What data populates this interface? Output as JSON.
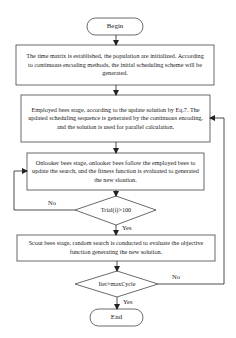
{
  "flowchart": {
    "begin": "Begin",
    "init_step": "The time matrix is established, the population are initialized. According to continuous encoding methods, the initial scheduling scheme will be generated.",
    "employed_step": "Employed bees stage, according to the update solution by Eq.7. The updated scheduling sequence is generated by the continuous encoding, and the solution is used for parallel calculation.",
    "onlooker_step": "Onlooker bees stage, onlooker bees follow the employed bees to update the search, and the fitness function is evaluated to generated the new sloution.",
    "trial_decision": "Trial(i)>100",
    "trial_no": "No",
    "trial_yes": "Yes",
    "scout_step": "Scout bees stage, random search is conducted to evaluate the objective function generating the new solution.",
    "iter_decision": "Iter>maxCycle",
    "iter_no": "No",
    "iter_yes": "Yes",
    "end": "End"
  }
}
